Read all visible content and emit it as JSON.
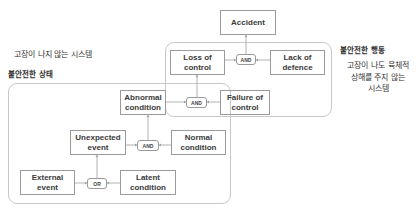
{
  "labels": {
    "safe_system_left": "고장이 나지 않는 시스템",
    "unsafe_state": "불안전한 상태",
    "unsafe_action": "불안전한 행동",
    "safe_system_right": "고장이 나도 육체적\n상해를 주지 않는\n시스템"
  },
  "nodes": {
    "accident": "Accident",
    "loss_of_control": "Loss of\ncontrol",
    "lack_of_defence": "Lack of\ndefence",
    "abnormal_condition": "Abnormal\ncondition",
    "failure_of_control": "Failure of\ncontrol",
    "unexpected_event": "Unexpected\nevent",
    "normal_condition": "Normal\ncondition",
    "external_event": "External\nevent",
    "latent_condition": "Latent\ncondition"
  },
  "gates": {
    "and_top": "AND",
    "and_middle": "AND",
    "and_lower": "AND",
    "or_bottom": "OR"
  },
  "colors": {
    "box_border": "#9a9a9a",
    "group_border": "#c8c8c8",
    "connector": "#a0a0a0",
    "text": "#333333"
  }
}
